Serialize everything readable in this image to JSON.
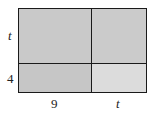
{
  "diagram": {
    "type": "area-model-rectangle",
    "side_labels": {
      "left_top": "t",
      "left_bottom": "4",
      "bottom_left": "9",
      "bottom_right": "t"
    },
    "colors": {
      "border": "#1a1a1a",
      "cell_top_left": "#c9c9c9",
      "cell_top_right": "#cbcbcb",
      "cell_bottom_left": "#c6c6c6",
      "cell_bottom_right": "#dcdcdc"
    }
  }
}
